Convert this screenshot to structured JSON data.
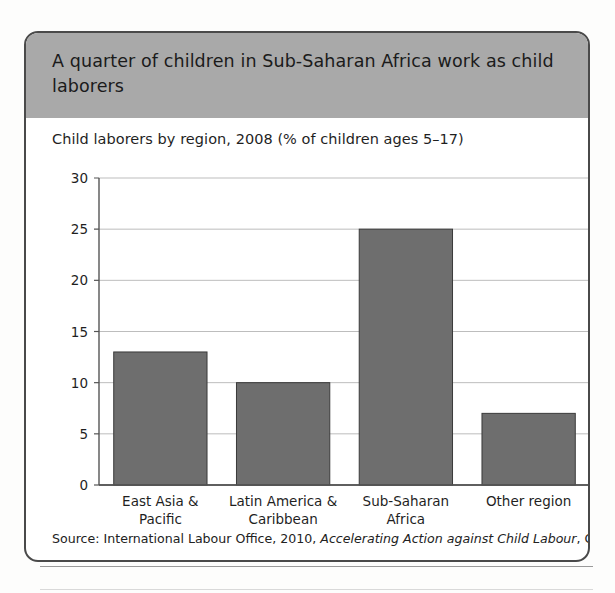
{
  "figure": {
    "title": "A quarter of children in Sub-Saharan Africa work as child laborers",
    "subtitle": "Child laborers by region, 2008 (% of children ages 5–17)",
    "source_prefix": "Source: International Labour Office, 2010, ",
    "source_italic": "Accelerating Action against Child Labour",
    "source_suffix": ", Geneva"
  },
  "colors": {
    "header_band": "#a9a9a9",
    "bar_fill": "#6e6e6e",
    "bar_stroke": "#3a3a3a",
    "gridline": "#bdbdbd",
    "axis": "#555555",
    "card_border": "#4a4a4a",
    "text": "#1b1b1b"
  },
  "chart_data": {
    "type": "bar",
    "title": "Child laborers by region, 2008 (% of children ages 5–17)",
    "xlabel": "",
    "ylabel": "",
    "categories": [
      "East Asia &\nPacific",
      "Latin America &\nCaribbean",
      "Sub-Saharan\nAfrica",
      "Other region"
    ],
    "category_lines": [
      [
        "East Asia &",
        "Pacific"
      ],
      [
        "Latin America &",
        "Caribbean"
      ],
      [
        "Sub-Saharan",
        "Africa"
      ],
      [
        "Other region"
      ]
    ],
    "values": [
      13,
      10,
      25,
      7
    ],
    "ylim": [
      0,
      30
    ],
    "yticks": [
      0,
      5,
      10,
      15,
      20,
      25,
      30
    ],
    "ytick_labels": [
      "0",
      "5",
      "10",
      "15",
      "20",
      "25",
      "30"
    ],
    "grid": true,
    "legend": false,
    "legend_position": "none",
    "units": "% of children ages 5-17"
  }
}
